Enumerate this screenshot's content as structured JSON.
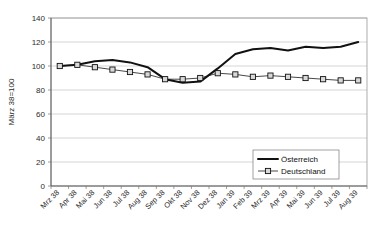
{
  "chart_data": {
    "type": "line",
    "title": "",
    "xlabel": "",
    "ylabel": "März 38=100",
    "ylim": [
      0,
      140
    ],
    "ytick_step": 20,
    "yticks": [
      0,
      20,
      40,
      60,
      80,
      100,
      120,
      140
    ],
    "grid": true,
    "legend_position": "bottom-right",
    "categories": [
      "Mrz 38",
      "Apr 38",
      "Mai 38",
      "Jun 38",
      "Jul 38",
      "Aug 38",
      "Sep 38",
      "Okt 38",
      "Nov 38",
      "Dez 38",
      "Jan 39",
      "Feb 39",
      "Mrz 39",
      "Apr 39",
      "Mai 39",
      "Jun 39",
      "Jul 39",
      "Aug 39"
    ],
    "series": [
      {
        "name": "Österreich",
        "marker": "none",
        "values": [
          100,
          101,
          104,
          105,
          103,
          99,
          89,
          86,
          87,
          98,
          110,
          114,
          115,
          113,
          116,
          115,
          116,
          120
        ]
      },
      {
        "name": "Deutschland",
        "marker": "square",
        "values": [
          100,
          101,
          99,
          97,
          95,
          93,
          89,
          89,
          90,
          94,
          93,
          91,
          92,
          91,
          90,
          89,
          88,
          88
        ]
      }
    ]
  },
  "legend": {
    "items": [
      {
        "label": "Österreich"
      },
      {
        "label": "Deutschland"
      }
    ]
  },
  "axes": {
    "y_title": "März 38=100",
    "y_tick_labels": [
      "140",
      "120",
      "100",
      "80",
      "60",
      "40",
      "20",
      "0"
    ],
    "x_tick_labels": [
      "Mrz 38",
      "Apr 38",
      "Mai 38",
      "Jun 38",
      "Jul 38",
      "Aug 38",
      "Sep 38",
      "Okt 38",
      "Nov 38",
      "Dez 38",
      "Jan 39",
      "Feb 39",
      "Mrz 39",
      "Apr 39",
      "Mai 39",
      "Jun 39",
      "Jul 39",
      "Aug 39"
    ]
  },
  "colors": {
    "series_austria": "#111111",
    "series_germany": "#333333",
    "grid": "#b9b9b9",
    "axis": "#555555",
    "background": "#ffffff"
  }
}
